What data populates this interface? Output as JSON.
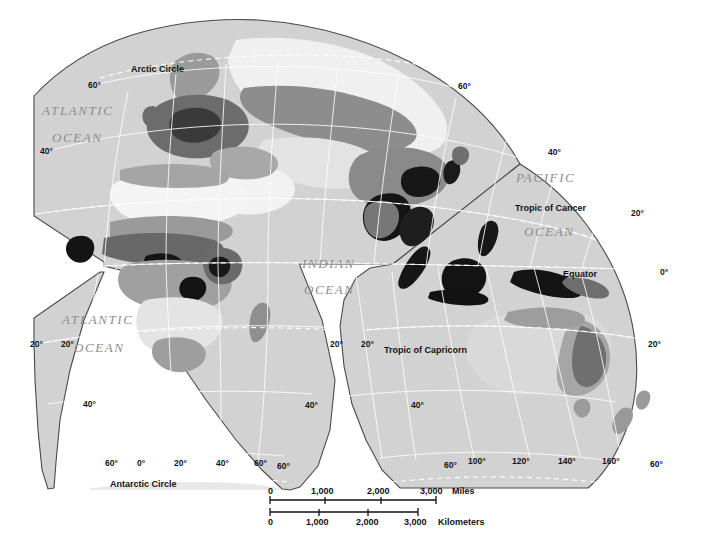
{
  "map": {
    "projection_note": "interrupted-homolosine",
    "background_color": "#ffffff",
    "ocean_fill": "#d2d2d2",
    "outline_color": "#4a4a4a",
    "graticule_color": "#ffffff",
    "ocean_labels": [
      {
        "name": "atlantic-ocean-north",
        "line1": "ATLANTIC",
        "line2": "OCEAN",
        "x": 56,
        "y": 110
      },
      {
        "name": "atlantic-ocean-south",
        "line1": "ATLANTIC",
        "line2": "OCEAN",
        "x": 76,
        "y": 312
      },
      {
        "name": "indian-ocean",
        "line1": "INDIAN",
        "line2": "OCEAN",
        "x": 308,
        "y": 260
      },
      {
        "name": "pacific-ocean",
        "line1": "PACIFIC",
        "line2": "OCEAN",
        "x": 519,
        "y": 175
      }
    ],
    "reference_lines": [
      {
        "name": "arctic-circle",
        "label": "Arctic Circle",
        "x": 131,
        "y": 66
      },
      {
        "name": "tropic-of-cancer",
        "label": "Tropic of Cancer",
        "x": 515,
        "y": 202
      },
      {
        "name": "equator",
        "label": "Equator",
        "x": 563,
        "y": 269
      },
      {
        "name": "tropic-of-capricorn",
        "label": "Tropic of Capricorn",
        "x": 384,
        "y": 348
      },
      {
        "name": "antarctic-circle",
        "label": "Antarctic Circle",
        "x": 110,
        "y": 482
      }
    ],
    "graticule_labels": [
      {
        "name": "lat-60-n-left",
        "text": "60°",
        "x": 88,
        "y": 85
      },
      {
        "name": "lat-40-n-left",
        "text": "40°",
        "x": 42,
        "y": 151
      },
      {
        "name": "lat-20-s-left-a",
        "text": "20°",
        "x": 32,
        "y": 344
      },
      {
        "name": "lat-20-s-left-b",
        "text": "20°",
        "x": 64,
        "y": 344
      },
      {
        "name": "lat-40-s-left",
        "text": "40°",
        "x": 85,
        "y": 404
      },
      {
        "name": "lat-60-s-left",
        "text": "60°",
        "x": 108,
        "y": 463
      },
      {
        "name": "lon-0",
        "text": "0°",
        "x": 138,
        "y": 463
      },
      {
        "name": "lon-20-e",
        "text": "20°",
        "x": 176,
        "y": 463
      },
      {
        "name": "lon-40-e",
        "text": "40°",
        "x": 218,
        "y": 463
      },
      {
        "name": "lon-60-e",
        "text": "60°",
        "x": 256,
        "y": 463
      },
      {
        "name": "lat-60-s-right",
        "text": "60°",
        "x": 279,
        "y": 466
      },
      {
        "name": "lat-40-s-right",
        "text": "40°",
        "x": 307,
        "y": 405
      },
      {
        "name": "lat-20-s-right-a",
        "text": "20°",
        "x": 332,
        "y": 344
      },
      {
        "name": "lat-20-s-right-b",
        "text": "20°",
        "x": 363,
        "y": 344
      },
      {
        "name": "lat-40-s-aus",
        "text": "40°",
        "x": 414,
        "y": 405
      },
      {
        "name": "lat-60-s-aus",
        "text": "60°",
        "x": 447,
        "y": 465
      },
      {
        "name": "lon-100-e",
        "text": "100°",
        "x": 472,
        "y": 461
      },
      {
        "name": "lon-120-e",
        "text": "120°",
        "x": 516,
        "y": 461
      },
      {
        "name": "lon-140-e",
        "text": "140°",
        "x": 562,
        "y": 461
      },
      {
        "name": "lon-160-e",
        "text": "160°",
        "x": 606,
        "y": 461
      },
      {
        "name": "lat-60-s-far-right",
        "text": "60°",
        "x": 652,
        "y": 464
      },
      {
        "name": "lat-60-n-right",
        "text": "60°",
        "x": 460,
        "y": 86
      },
      {
        "name": "lat-40-n-right",
        "text": "40°",
        "x": 550,
        "y": 152
      },
      {
        "name": "lat-20-n-right",
        "text": "20°",
        "x": 633,
        "y": 213
      },
      {
        "name": "lat-0-right",
        "text": "0°",
        "x": 662,
        "y": 272
      },
      {
        "name": "lat-20-s-far-right",
        "text": "20°",
        "x": 650,
        "y": 344
      }
    ],
    "scalebar": {
      "miles": {
        "ticks": [
          "0",
          "1,000",
          "2,000",
          "3,000"
        ],
        "unit": "Miles"
      },
      "kilometers": {
        "ticks": [
          "0",
          "1,000",
          "2,000",
          "3,000"
        ],
        "unit": "Kilometers"
      }
    },
    "shading_legend": {
      "note": "grayscale choropleth classes",
      "classes": [
        {
          "name": "class-lowest",
          "color": "#f2f2f2"
        },
        {
          "name": "class-low",
          "color": "#d8d8d8"
        },
        {
          "name": "class-medium",
          "color": "#b0b0b0"
        },
        {
          "name": "class-high",
          "color": "#8a8a8a"
        },
        {
          "name": "class-higher",
          "color": "#5c5c5c"
        },
        {
          "name": "class-highest",
          "color": "#121212"
        }
      ]
    }
  }
}
